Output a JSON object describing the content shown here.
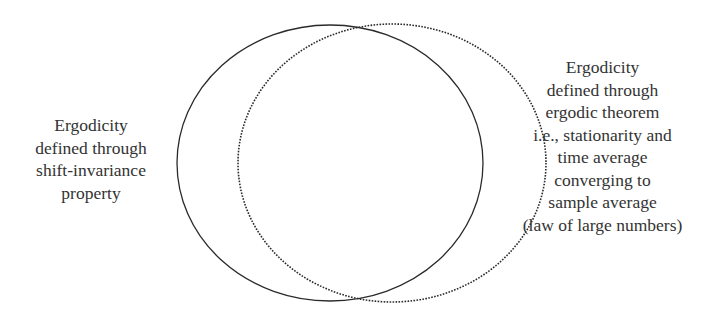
{
  "diagram": {
    "type": "venn",
    "left_set": {
      "name": "shift-invariance",
      "stroke": "solid",
      "label_lines": [
        "Ergodicity",
        "defined through",
        "shift-invariance",
        "property"
      ]
    },
    "right_set": {
      "name": "ergodic-theorem",
      "stroke": "dotted",
      "label_lines": [
        "Ergodicity",
        "defined through",
        "ergodic theorem",
        "i.e., stationarity and",
        "time average",
        "converging to",
        "sample average",
        "(law of large numbers)"
      ]
    },
    "line_color": "#2a2a2a"
  }
}
